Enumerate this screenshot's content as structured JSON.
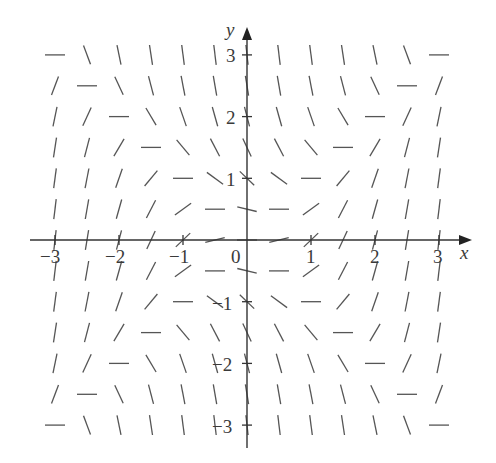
{
  "chart_data": {
    "type": "slope_field",
    "title": "",
    "equation": "dy/dx = x^2 - y^2",
    "xlabel": "x",
    "ylabel": "y",
    "xlim": [
      -3,
      3
    ],
    "ylim": [
      -3,
      3
    ],
    "x_ticks": [
      -3,
      -2,
      -1,
      0,
      1,
      2,
      3
    ],
    "y_ticks": [
      -3,
      -2,
      -1,
      0,
      1,
      2,
      3
    ],
    "x_tick_labels": [
      "−3",
      "−2",
      "−1",
      "0",
      "1",
      "2",
      "3"
    ],
    "y_tick_labels": [
      "−3",
      "−2",
      "−1",
      "",
      "1",
      "2",
      "3"
    ],
    "grid_step": 0.5,
    "grid_x": [
      -3,
      -2.5,
      -2,
      -1.5,
      -1,
      -0.5,
      0,
      0.5,
      1,
      1.5,
      2,
      2.5,
      3
    ],
    "grid_y": [
      -3,
      -2.5,
      -2,
      -1.5,
      -1,
      -0.5,
      0,
      0.5,
      1,
      1.5,
      2,
      2.5,
      3
    ],
    "zero_slope_lines": [
      "y = x",
      "y = -x"
    ],
    "grid": false,
    "legend": null
  },
  "axes": {
    "x_name": "x",
    "y_name": "y",
    "origin_label": "0"
  },
  "style": {
    "segment_color": "#555555",
    "axis_color": "#333333"
  }
}
